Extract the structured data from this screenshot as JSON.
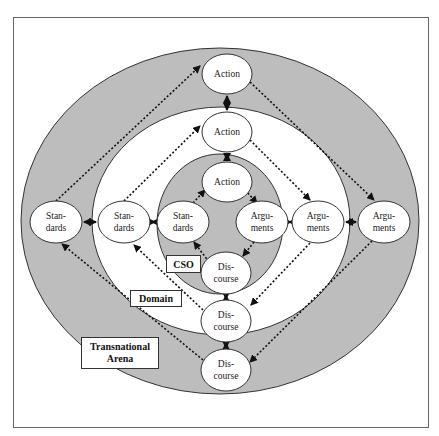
{
  "diagram": {
    "colors": {
      "gray_band": "#bdbdbd",
      "white": "#ffffff",
      "stroke": "#333333",
      "frame": "#666666"
    },
    "regions": {
      "transnational_arena": {
        "label_line1": "Transnational",
        "label_line2": "Arena"
      },
      "domain": {
        "label": "Domain"
      },
      "cso": {
        "label": "CSO"
      }
    },
    "nodes": {
      "action_outer": {
        "line1": "Action"
      },
      "action_middle": {
        "line1": "Action"
      },
      "action_inner": {
        "line1": "Action"
      },
      "standards_outer": {
        "line1": "Stan-",
        "line2": "dards"
      },
      "standards_middle": {
        "line1": "Stan-",
        "line2": "dards"
      },
      "standards_inner": {
        "line1": "Stan-",
        "line2": "dards"
      },
      "arguments_inner": {
        "line1": "Argu-",
        "line2": "ments"
      },
      "arguments_middle": {
        "line1": "Argu-",
        "line2": "ments"
      },
      "arguments_outer": {
        "line1": "Argu-",
        "line2": "ments"
      },
      "discourse_inner": {
        "line1": "Dis-",
        "line2": "course"
      },
      "discourse_middle": {
        "line1": "Dis-",
        "line2": "course"
      },
      "discourse_outer": {
        "line1": "Dis-",
        "line2": "course"
      }
    },
    "edges_dotted": [
      "standards -> action",
      "action -> arguments",
      "arguments -> discourse",
      "discourse -> standards"
    ],
    "edges_bidirectional": [
      "action_outer <-> action_middle",
      "action_middle <-> action_inner",
      "standards_outer <-> standards_middle",
      "standards_middle <-> standards_inner",
      "arguments_inner <-> arguments_middle",
      "arguments_middle <-> arguments_outer",
      "discourse_inner <-> discourse_middle",
      "discourse_middle <-> discourse_outer"
    ]
  }
}
